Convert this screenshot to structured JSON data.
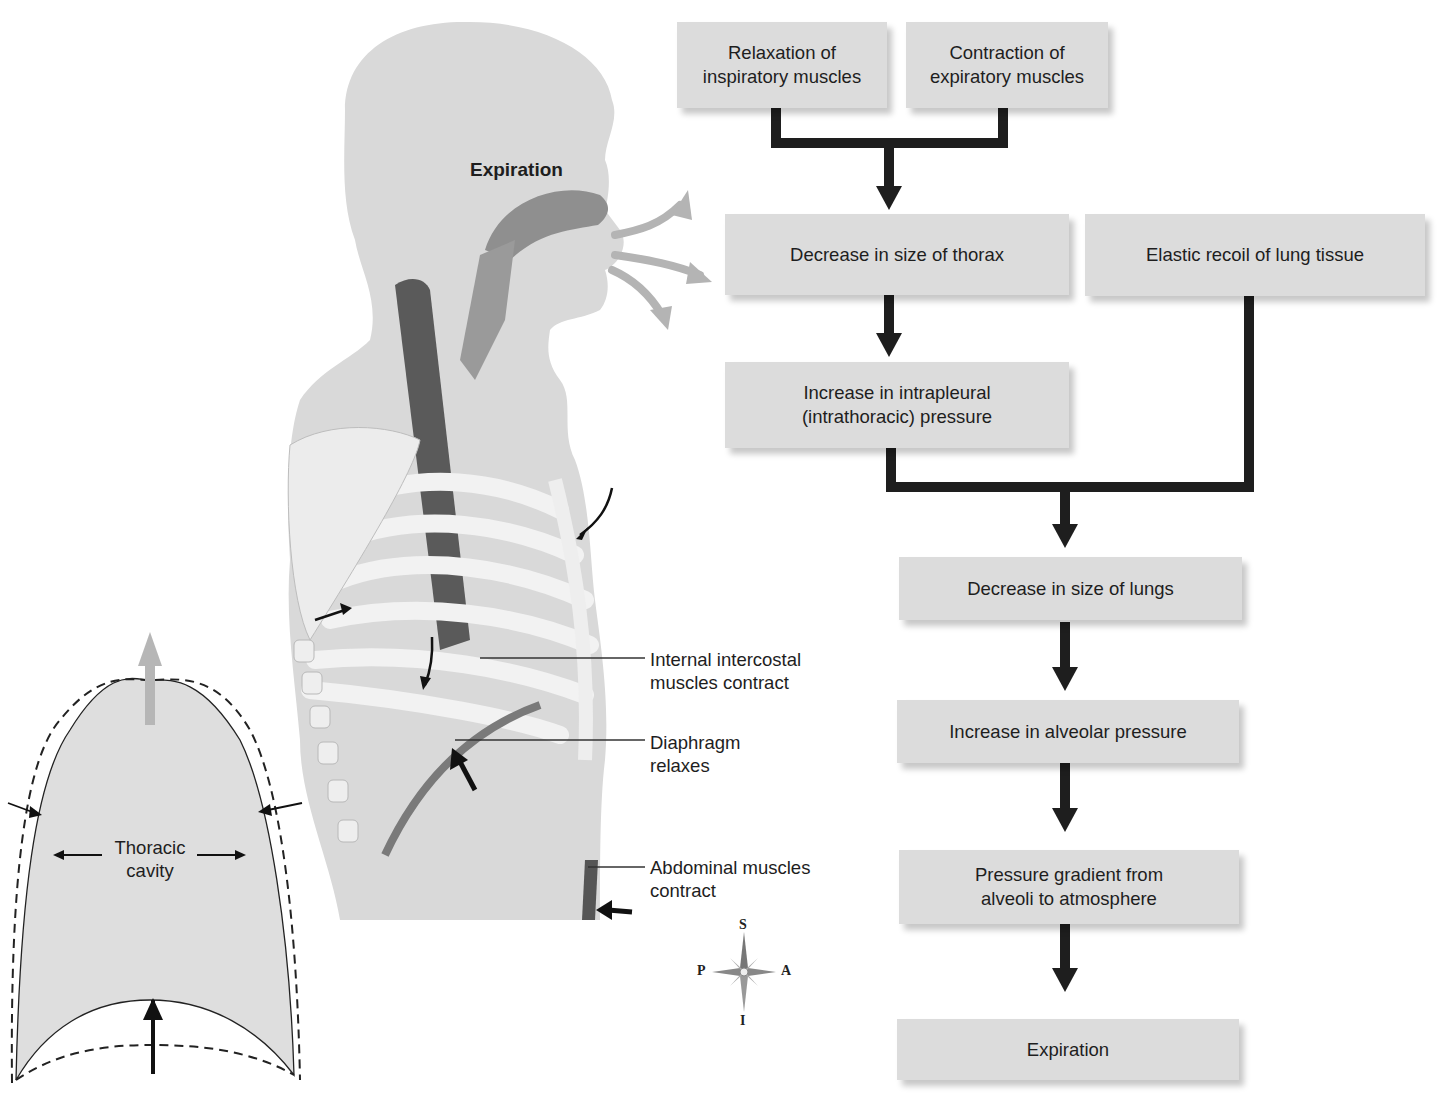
{
  "figure": {
    "title": "Expiration",
    "anatomy_labels": [
      {
        "id": "internal-intercostal",
        "line1": "Internal intercostal",
        "line2": "muscles contract"
      },
      {
        "id": "diaphragm",
        "line1": "Diaphragm",
        "line2": "relaxes"
      },
      {
        "id": "abdominal",
        "line1": "Abdominal muscles",
        "line2": "contract"
      }
    ],
    "thoracic_cavity": {
      "line1": "Thoracic",
      "line2": "cavity"
    },
    "compass": {
      "superior": "S",
      "inferior": "I",
      "posterior": "P",
      "anterior": "A"
    }
  },
  "flowchart": {
    "boxes": [
      {
        "id": "relax-insp",
        "line1": "Relaxation of",
        "line2": "inspiratory muscles"
      },
      {
        "id": "contract-exp",
        "line1": "Contraction of",
        "line2": "expiratory muscles"
      },
      {
        "id": "dec-thorax",
        "line1": "Decrease in size of thorax",
        "line2": ""
      },
      {
        "id": "elastic-recoil",
        "line1": "Elastic recoil of lung tissue",
        "line2": ""
      },
      {
        "id": "inc-intrapleural",
        "line1": "Increase in intrapleural",
        "line2": "(intrathoracic) pressure"
      },
      {
        "id": "dec-lungs",
        "line1": "Decrease in size of lungs",
        "line2": ""
      },
      {
        "id": "inc-alveolar",
        "line1": "Increase in alveolar pressure",
        "line2": ""
      },
      {
        "id": "gradient",
        "line1": "Pressure gradient from",
        "line2": "alveoli to atmosphere"
      },
      {
        "id": "expiration",
        "line1": "Expiration",
        "line2": ""
      }
    ]
  },
  "colors": {
    "box_fill": "#dcdcdc",
    "connector": "#1e1e1e",
    "body_tone": "#d8d8d8",
    "airflow": "#b4b4b4"
  }
}
